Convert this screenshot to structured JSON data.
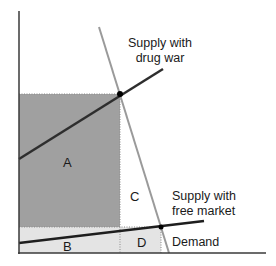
{
  "diagram": {
    "title": "",
    "colors": {
      "area_A": "#a0a0a0",
      "area_BD": "#e4e4e4",
      "supply_line": "#2e2e2e",
      "demand_line": "#9a9a9a",
      "axis": "#3a3a3a",
      "dotted": "#8a8a8a"
    },
    "labels": {
      "supply_drug_war_line1": "Supply with",
      "supply_drug_war_line2": "drug war",
      "supply_free_market_line1": "Supply with",
      "supply_free_market_line2": "free market",
      "demand": "Demand"
    },
    "regions": {
      "A": "A",
      "B": "B",
      "C": "C",
      "D": "D"
    }
  }
}
